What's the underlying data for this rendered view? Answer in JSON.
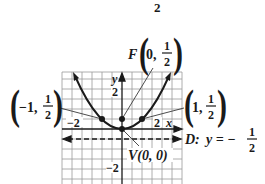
{
  "figure": {
    "top_fragment": "2",
    "equation": "y = x^2 / 2",
    "axis_labels": {
      "x": "x",
      "y": "y"
    },
    "tick_labels": {
      "x_neg": "−2",
      "x_pos": "2",
      "y_pos": "2",
      "y_neg": "−2"
    },
    "focus": {
      "name": "F",
      "coords": "0,",
      "frac_num": "1",
      "frac_den": "2"
    },
    "vertex": {
      "label": "V(0, 0)"
    },
    "point_left": {
      "coords": "−1,",
      "frac_num": "1",
      "frac_den": "2"
    },
    "point_right": {
      "coords": "1,",
      "frac_num": "1",
      "frac_den": "2"
    },
    "directrix": {
      "prefix": "D:",
      "eq": "y = −",
      "frac_num": "1",
      "frac_den": "2"
    },
    "colors": {
      "ink": "#1a1a1a",
      "grid": "#9a9a9a",
      "background": "#ffffff"
    }
  }
}
